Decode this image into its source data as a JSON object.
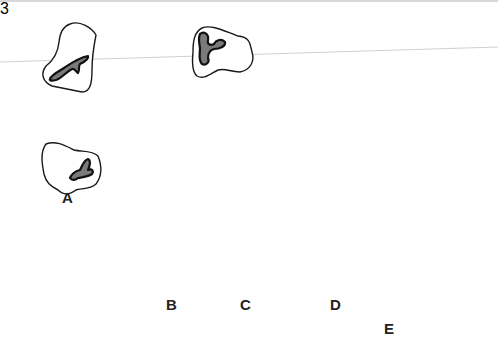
{
  "figure": {
    "labels": {
      "a": "A",
      "b": "B",
      "c": "C",
      "d": "D",
      "e": "E"
    },
    "colors": {
      "outline": "#1a1a1a",
      "nucleus_fill": "#7a7a7a",
      "background": "#ffffff",
      "guide_line": "#cfcfcf"
    },
    "elements": [
      {
        "id": "free-cell-1",
        "type": "leukocyte",
        "position": "top-left"
      },
      {
        "id": "free-cell-2",
        "type": "leukocyte",
        "position": "top-center"
      },
      {
        "id": "cell-A",
        "type": "leukocyte",
        "label": "A",
        "state": "circulating"
      },
      {
        "id": "cell-B",
        "type": "leukocyte",
        "label": "B",
        "state": "rolling",
        "arrow": "clockwise"
      },
      {
        "id": "cell-C",
        "type": "leukocyte",
        "label": "C",
        "state": "firm adhesion"
      },
      {
        "id": "cell-D",
        "type": "endothelial",
        "label": "D",
        "state": "junction"
      },
      {
        "id": "cell-E",
        "type": "leukocyte",
        "label": "E",
        "state": "transmigration"
      },
      {
        "id": "endothelium",
        "type": "endothelial-layer"
      }
    ]
  }
}
